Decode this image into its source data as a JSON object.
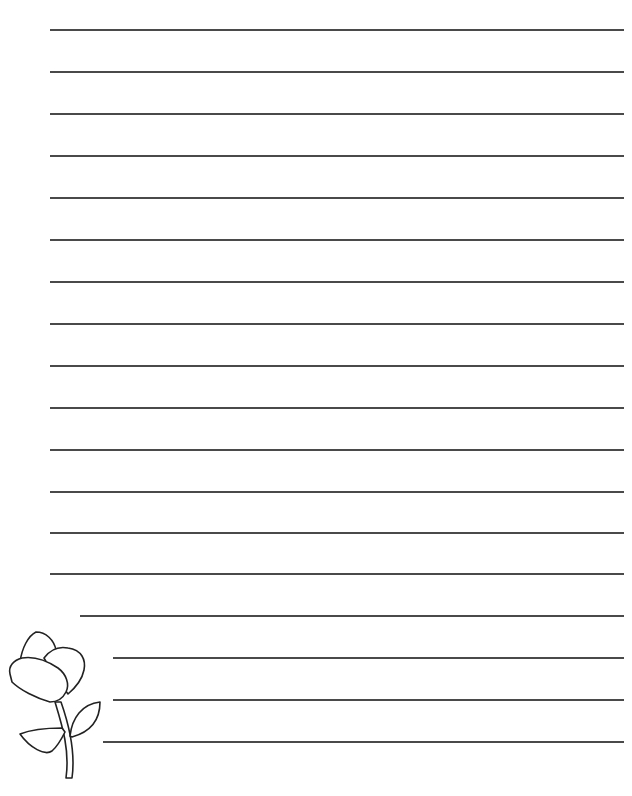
{
  "page": {
    "type": "lined writing paper",
    "line_color": "#4a4a4a",
    "background": "#ffffff"
  },
  "lines": [
    {
      "y": 29,
      "x1": 50,
      "x2": 624
    },
    {
      "y": 71,
      "x1": 50,
      "x2": 624
    },
    {
      "y": 113,
      "x1": 50,
      "x2": 624
    },
    {
      "y": 155,
      "x1": 50,
      "x2": 624
    },
    {
      "y": 197,
      "x1": 50,
      "x2": 624
    },
    {
      "y": 239,
      "x1": 50,
      "x2": 624
    },
    {
      "y": 281,
      "x1": 50,
      "x2": 624
    },
    {
      "y": 323,
      "x1": 50,
      "x2": 624
    },
    {
      "y": 365,
      "x1": 50,
      "x2": 624
    },
    {
      "y": 407,
      "x1": 50,
      "x2": 624
    },
    {
      "y": 449,
      "x1": 50,
      "x2": 624
    },
    {
      "y": 491,
      "x1": 50,
      "x2": 624
    },
    {
      "y": 532,
      "x1": 50,
      "x2": 624
    },
    {
      "y": 573,
      "x1": 50,
      "x2": 624
    },
    {
      "y": 615,
      "x1": 80,
      "x2": 624
    },
    {
      "y": 657,
      "x1": 113,
      "x2": 624
    },
    {
      "y": 699,
      "x1": 113,
      "x2": 624
    },
    {
      "y": 741,
      "x1": 103,
      "x2": 624
    }
  ],
  "decoration": {
    "icon": "flower-icon",
    "description": "outline tulip flower with two leaves"
  }
}
